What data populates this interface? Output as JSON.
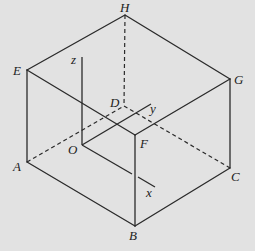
{
  "diagram": {
    "type": "cuboid-with-coordinate-axes",
    "vertices": {
      "H": {
        "label": "H",
        "x": 125,
        "y": 15
      },
      "E": {
        "label": "E",
        "x": 27,
        "y": 70
      },
      "G": {
        "label": "G",
        "x": 230,
        "y": 79
      },
      "D": {
        "label": "D",
        "x": 124,
        "y": 106
      },
      "F": {
        "label": "F",
        "x": 135,
        "y": 135
      },
      "A": {
        "label": "A",
        "x": 27,
        "y": 162
      },
      "C": {
        "label": "C",
        "x": 230,
        "y": 168
      },
      "B": {
        "label": "B",
        "x": 135,
        "y": 226
      }
    },
    "origin": {
      "label": "O",
      "x": 82,
      "y": 145
    },
    "axes": {
      "x": {
        "label": "x"
      },
      "y": {
        "label": "y"
      },
      "z": {
        "label": "z"
      }
    },
    "visible_edges": [
      "HE",
      "HG",
      "EF",
      "FG",
      "EA",
      "FB",
      "GC",
      "AB",
      "BC"
    ],
    "hidden_edges": [
      "HD",
      "AD",
      "DC"
    ]
  }
}
